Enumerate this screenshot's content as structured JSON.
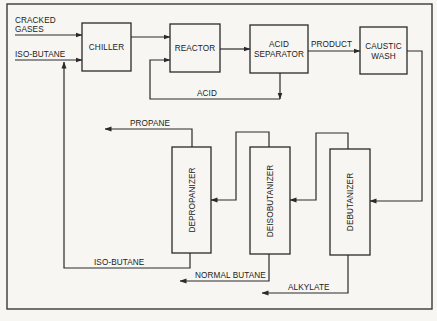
{
  "diagram": {
    "inputs": {
      "cracked_gases_line1": "CRACKED",
      "cracked_gases_line2": "GASES",
      "iso_butane": "ISO-BUTANE"
    },
    "units": {
      "chiller": "CHILLER",
      "reactor": "REACTOR",
      "acid_separator_line1": "ACID",
      "acid_separator_line2": "SEPARATOR",
      "caustic_wash_line1": "CAUSTIC",
      "caustic_wash_line2": "WASH",
      "depropanizer": "DEPROPANIZER",
      "deisobutanizer": "DEISOBUTANIZER",
      "debutanizer": "DEBUTANIZER"
    },
    "streams": {
      "product": "PRODUCT",
      "acid": "ACID",
      "propane": "PROPANE",
      "iso_butane_recycle": "ISO-BUTANE",
      "normal_butane": "NORMAL BUTANE",
      "alkylate": "ALKYLATE"
    },
    "flows": [
      {
        "from": "cracked_gases",
        "to": "chiller"
      },
      {
        "from": "iso_butane",
        "to": "chiller"
      },
      {
        "from": "chiller",
        "to": "reactor"
      },
      {
        "from": "reactor",
        "to": "acid_separator"
      },
      {
        "from": "acid_separator",
        "to": "reactor",
        "label": "ACID"
      },
      {
        "from": "acid_separator",
        "to": "caustic_wash",
        "label": "PRODUCT"
      },
      {
        "from": "caustic_wash",
        "to": "debutanizer"
      },
      {
        "from": "debutanizer",
        "to": "deisobutanizer"
      },
      {
        "from": "deisobutanizer",
        "to": "depropanizer"
      },
      {
        "from": "depropanizer",
        "to": "out",
        "label": "PROPANE"
      },
      {
        "from": "depropanizer",
        "to": "chiller",
        "label": "ISO-BUTANE"
      },
      {
        "from": "deisobutanizer",
        "to": "out",
        "label": "NORMAL BUTANE"
      },
      {
        "from": "debutanizer",
        "to": "out",
        "label": "ALKYLATE"
      }
    ]
  }
}
